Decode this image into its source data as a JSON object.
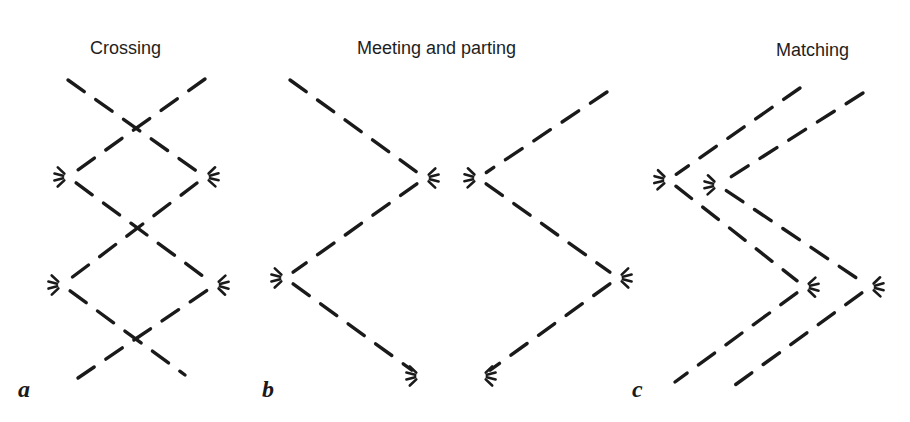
{
  "figure": {
    "stroke_color": "#1a1a1a",
    "background": "#ffffff",
    "panels": [
      {
        "id": "a",
        "label": "a",
        "title": "Crossing",
        "description": "Two dashed paths cross each other repeatedly, each turning at whisker marks",
        "paths": [
          {
            "name": "path-1",
            "points": [
              [
                68,
                80
              ],
              [
                205,
                177
              ],
              [
                62,
                285
              ],
              [
                185,
                375
              ]
            ],
            "turns": [
              1,
              2
            ]
          },
          {
            "name": "path-2",
            "points": [
              [
                205,
                79
              ],
              [
                68,
                177
              ],
              [
                215,
                285
              ],
              [
                78,
                378
              ]
            ],
            "turns": [
              1,
              2
            ]
          }
        ]
      },
      {
        "id": "b",
        "label": "b",
        "title": "Meeting and parting",
        "description": "Two dashed paths approach, meet at whisker marks, then diverge and rejoin",
        "paths": [
          {
            "name": "path-1",
            "points": [
              [
                290,
                80
              ],
              [
                425,
                178
              ],
              [
                285,
                278
              ],
              [
                420,
                376
              ]
            ],
            "turns": [
              1,
              2,
              3
            ]
          },
          {
            "name": "path-2",
            "points": [
              [
                607,
                92
              ],
              [
                478,
                178
              ],
              [
                618,
                278
              ],
              [
                482,
                376
              ]
            ],
            "turns": [
              1,
              2,
              3
            ]
          }
        ]
      },
      {
        "id": "c",
        "label": "c",
        "title": "Matching",
        "description": "Two dashed paths run in parallel, turning at matching whisker marks",
        "paths": [
          {
            "name": "path-1",
            "points": [
              [
                800,
                88
              ],
              [
                668,
                180
              ],
              [
                805,
                287
              ],
              [
                675,
                382
              ]
            ],
            "turns": [
              1,
              2
            ]
          },
          {
            "name": "path-2",
            "points": [
              [
                863,
                93
              ],
              [
                718,
                185
              ],
              [
                870,
                287
              ],
              [
                735,
                385
              ]
            ],
            "turns": [
              1,
              2
            ]
          }
        ]
      }
    ]
  }
}
